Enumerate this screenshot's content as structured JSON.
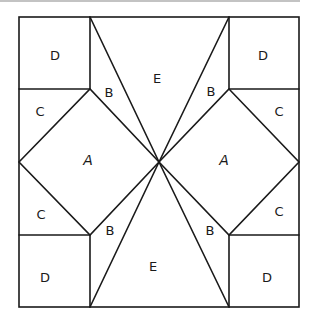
{
  "diagram": {
    "type": "quilt-block-pattern",
    "colors": {
      "line": "#1a1a1a",
      "background": "#ffffff",
      "top_rule": "#888888"
    },
    "pieces": [
      {
        "id": "d-top-left",
        "label": "D",
        "x": 55,
        "y": 55
      },
      {
        "id": "d-top-right",
        "label": "D",
        "x": 263,
        "y": 55
      },
      {
        "id": "d-bottom-left",
        "label": "D",
        "x": 45,
        "y": 277
      },
      {
        "id": "d-bottom-right",
        "label": "D",
        "x": 267,
        "y": 277
      },
      {
        "id": "c-top-left",
        "label": "C",
        "x": 40,
        "y": 111
      },
      {
        "id": "c-top-right",
        "label": "C",
        "x": 279,
        "y": 111
      },
      {
        "id": "c-mid-left",
        "label": "C",
        "x": 41,
        "y": 214
      },
      {
        "id": "c-mid-right",
        "label": "C",
        "x": 279,
        "y": 211
      },
      {
        "id": "b-top-left",
        "label": "B",
        "x": 109,
        "y": 92
      },
      {
        "id": "b-top-right",
        "label": "B",
        "x": 211,
        "y": 91
      },
      {
        "id": "b-bottom-left",
        "label": "B",
        "x": 110,
        "y": 230
      },
      {
        "id": "b-bottom-right",
        "label": "B",
        "x": 210,
        "y": 230
      },
      {
        "id": "e-top",
        "label": "E",
        "x": 157,
        "y": 78
      },
      {
        "id": "e-bottom",
        "label": "E",
        "x": 153,
        "y": 266
      },
      {
        "id": "a-left",
        "label": "A",
        "x": 88,
        "y": 160
      },
      {
        "id": "a-right",
        "label": "A",
        "x": 224,
        "y": 160
      }
    ]
  }
}
